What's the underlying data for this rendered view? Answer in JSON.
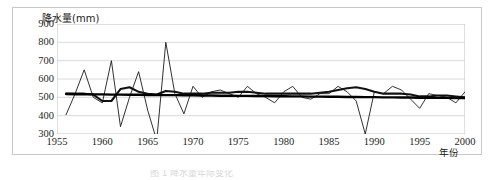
{
  "figure": {
    "caption_partial": "图 1  降水量年际变化"
  },
  "chart_data": {
    "type": "line",
    "title": "",
    "ylabel": "降水量(mm)",
    "xlabel": "年份",
    "ylim": [
      300,
      900
    ],
    "xlim": [
      1955,
      2000
    ],
    "ytick_labels": [
      "900",
      "800",
      "700",
      "600",
      "500",
      "400",
      "300"
    ],
    "yticks": [
      900,
      800,
      700,
      600,
      500,
      400,
      300
    ],
    "xtick_labels": [
      "1955",
      "1960",
      "1965",
      "1970",
      "1975",
      "1980",
      "1985",
      "1990",
      "1995",
      "2000"
    ],
    "xticks": [
      1955,
      1960,
      1965,
      1970,
      1975,
      1980,
      1985,
      1990,
      1995,
      2000
    ],
    "grid": true,
    "legend": "none",
    "x": [
      1956,
      1957,
      1958,
      1959,
      1960,
      1961,
      1962,
      1963,
      1964,
      1965,
      1966,
      1967,
      1968,
      1969,
      1970,
      1971,
      1972,
      1973,
      1974,
      1975,
      1976,
      1977,
      1978,
      1979,
      1980,
      1981,
      1982,
      1983,
      1984,
      1985,
      1986,
      1987,
      1988,
      1989,
      1990,
      1991,
      1992,
      1993,
      1994,
      1995,
      1996,
      1997,
      1998,
      1999,
      2000
    ],
    "series": [
      {
        "name": "年降水量",
        "style": "thin-jagged",
        "color": "#1a1a1a",
        "values": [
          405,
          520,
          650,
          500,
          470,
          700,
          340,
          500,
          640,
          430,
          265,
          800,
          520,
          410,
          560,
          500,
          530,
          540,
          520,
          500,
          560,
          520,
          500,
          470,
          530,
          560,
          500,
          490,
          520,
          520,
          560,
          530,
          480,
          300,
          530,
          520,
          560,
          540,
          490,
          440,
          520,
          510,
          500,
          470,
          530
        ]
      },
      {
        "name": "5年滑动平均",
        "style": "thick-smoothed",
        "color": "#111111",
        "values": [
          520,
          520,
          520,
          515,
          480,
          480,
          545,
          555,
          530,
          520,
          515,
          535,
          530,
          520,
          520,
          520,
          525,
          525,
          525,
          530,
          530,
          525,
          520,
          520,
          520,
          520,
          520,
          520,
          525,
          530,
          540,
          550,
          555,
          545,
          530,
          520,
          520,
          520,
          515,
          505,
          505,
          510,
          510,
          505,
          500
        ]
      },
      {
        "name": "线性趋势",
        "style": "straight-trend",
        "color": "#000000",
        "values": [
          518,
          517,
          517,
          516,
          516,
          515,
          515,
          514,
          514,
          513,
          513,
          512,
          512,
          511,
          511,
          510,
          510,
          509,
          509,
          508,
          508,
          507,
          507,
          506,
          506,
          505,
          505,
          504,
          504,
          503,
          503,
          502,
          502,
          501,
          501,
          500,
          500,
          499,
          499,
          498,
          498,
          497,
          497,
          496,
          496
        ]
      }
    ]
  }
}
